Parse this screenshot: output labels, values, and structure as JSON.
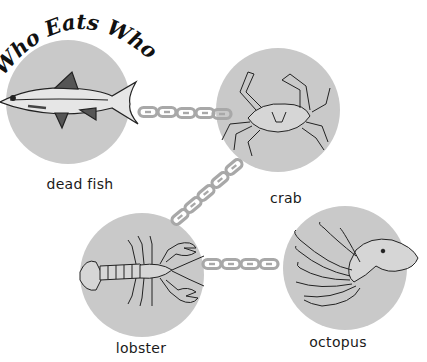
{
  "title": "Who Eats Who?",
  "colors": {
    "circle_fill": "#c9c9c9",
    "chain": "#a8a8a8",
    "outline": "#222222",
    "background": "#ffffff"
  },
  "nodes": [
    {
      "id": "dead_fish",
      "label": "dead fish",
      "icon": "fish-icon",
      "cx": 68,
      "cy": 102,
      "r": 62
    },
    {
      "id": "crab",
      "label": "crab",
      "icon": "crab-icon",
      "cx": 278,
      "cy": 110,
      "r": 62
    },
    {
      "id": "lobster",
      "label": "lobster",
      "icon": "lobster-icon",
      "cx": 142,
      "cy": 275,
      "r": 62
    },
    {
      "id": "octopus",
      "label": "octopus",
      "icon": "octopus-icon",
      "cx": 345,
      "cy": 268,
      "r": 62
    }
  ],
  "links": [
    {
      "from": "dead_fish",
      "to": "crab",
      "type": "chain"
    },
    {
      "from": "crab",
      "to": "lobster",
      "type": "chain"
    },
    {
      "from": "lobster",
      "to": "octopus",
      "type": "chain"
    }
  ],
  "labels": {
    "dead_fish": "dead fish",
    "crab": "crab",
    "lobster": "lobster",
    "octopus": "octopus"
  }
}
